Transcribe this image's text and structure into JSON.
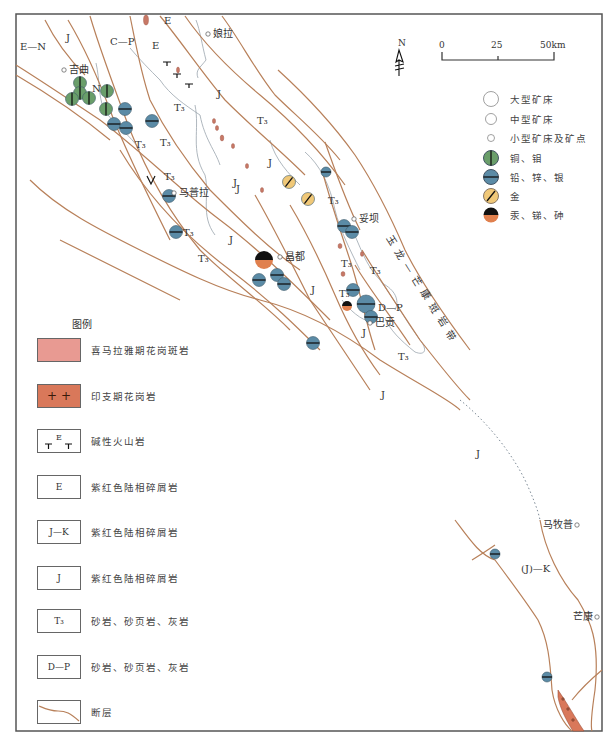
{
  "colors": {
    "fault": "#b8805a",
    "boundary": "#9aa4ad",
    "cu_mo": "#6a9e6a",
    "pb_zn_ag": "#5b8ba6",
    "au": "#f0c878",
    "hg_sb_as_top": "#111111",
    "hg_sb_as_bottom": "#e0804e",
    "himalayan_granite_porphyry": "#e89a92",
    "indosinian_granite": "#d9785a",
    "frame": "#555555"
  },
  "north_arrow": {
    "label": "N"
  },
  "scale_bar": {
    "ticks": [
      "0",
      "25",
      "50km"
    ]
  },
  "deposit_size_legend": [
    {
      "label": "大型矿床",
      "size": "large"
    },
    {
      "label": "中型矿床",
      "size": "medium"
    },
    {
      "label": "小型矿床及矿点",
      "size": "small"
    }
  ],
  "mineral_legend": [
    {
      "label": "铜、钼",
      "type": "cu_mo"
    },
    {
      "label": "铅、锌、银",
      "type": "pb_zn_ag"
    },
    {
      "label": "金",
      "type": "au"
    },
    {
      "label": "汞、锑、砷",
      "type": "hg_sb_as"
    }
  ],
  "legend": {
    "title": "图例",
    "items": [
      {
        "code": "",
        "label": "喜马拉雅期花岗斑岩",
        "style": "himalayan"
      },
      {
        "code": "+ +",
        "label": "印支期花岗岩",
        "style": "indosinian"
      },
      {
        "code": "E",
        "label": "碱性火山岩",
        "style": "volcanic"
      },
      {
        "code": "E",
        "label": "紫红色陆相碎屑岩",
        "style": "plain"
      },
      {
        "code": "J—K",
        "label": "紫红色陆相碎屑岩",
        "style": "plain"
      },
      {
        "code": "J",
        "label": "紫红色陆相碎屑岩",
        "style": "plain"
      },
      {
        "code": "T₃",
        "label": "砂岩、砂页岩、灰岩",
        "style": "plain"
      },
      {
        "code": "D—P",
        "label": "砂岩、砂页岩、灰岩",
        "style": "plain"
      },
      {
        "code": "",
        "label": "断层",
        "style": "fault"
      }
    ]
  },
  "places": [
    {
      "name": "娘拉",
      "x": 212,
      "y": 37
    },
    {
      "name": "吉曲",
      "x": 68,
      "y": 73
    },
    {
      "name": "马普拉",
      "x": 178,
      "y": 196
    },
    {
      "name": "妥坝",
      "x": 358,
      "y": 222
    },
    {
      "name": "昌都",
      "x": 284,
      "y": 260
    },
    {
      "name": "巴贡",
      "x": 374,
      "y": 326
    },
    {
      "name": "马牧普",
      "x": 543,
      "y": 528
    },
    {
      "name": "芒康",
      "x": 573,
      "y": 620
    }
  ],
  "unit_labels": [
    {
      "text": "E—N",
      "x": 20,
      "y": 50
    },
    {
      "text": "J",
      "x": 66,
      "y": 41
    },
    {
      "text": "C—P",
      "x": 110,
      "y": 45
    },
    {
      "text": "E",
      "x": 164,
      "y": 24
    },
    {
      "text": "E",
      "x": 152,
      "y": 49
    },
    {
      "text": "N",
      "x": 92,
      "y": 92
    },
    {
      "text": "J",
      "x": 217,
      "y": 97
    },
    {
      "text": "T₃",
      "x": 174,
      "y": 111
    },
    {
      "text": "T₃",
      "x": 135,
      "y": 148
    },
    {
      "text": "T₃",
      "x": 160,
      "y": 146
    },
    {
      "text": "T₃",
      "x": 164,
      "y": 180
    },
    {
      "text": "J",
      "x": 233,
      "y": 186
    },
    {
      "text": "T₃",
      "x": 257,
      "y": 124
    },
    {
      "text": "J",
      "x": 268,
      "y": 166
    },
    {
      "text": "J",
      "x": 236,
      "y": 192
    },
    {
      "text": "T₃",
      "x": 328,
      "y": 204
    },
    {
      "text": "T₃",
      "x": 183,
      "y": 236
    },
    {
      "text": "J",
      "x": 229,
      "y": 243
    },
    {
      "text": "T₃",
      "x": 198,
      "y": 262
    },
    {
      "text": "J",
      "x": 311,
      "y": 293
    },
    {
      "text": "T₃",
      "x": 341,
      "y": 267
    },
    {
      "text": "T₃",
      "x": 370,
      "y": 274
    },
    {
      "text": "T₃",
      "x": 339,
      "y": 297
    },
    {
      "text": "D—P",
      "x": 378,
      "y": 311
    },
    {
      "text": "J",
      "x": 362,
      "y": 336
    },
    {
      "text": "T₃",
      "x": 398,
      "y": 360
    },
    {
      "text": "J",
      "x": 381,
      "y": 398
    },
    {
      "text": "J",
      "x": 476,
      "y": 457
    },
    {
      "text": "(J)—K",
      "x": 521,
      "y": 572
    }
  ],
  "belt_label": "玉龙—芒康斑岩带",
  "deposits": [
    {
      "type": "cu_mo",
      "size": "medium",
      "x": 80,
      "y": 83
    },
    {
      "type": "cu_mo",
      "size": "medium",
      "x": 80,
      "y": 93
    },
    {
      "type": "cu_mo",
      "size": "medium",
      "x": 72,
      "y": 99
    },
    {
      "type": "cu_mo",
      "size": "medium",
      "x": 89,
      "y": 98
    },
    {
      "type": "cu_mo",
      "size": "medium",
      "x": 107,
      "y": 91
    },
    {
      "type": "cu_mo",
      "size": "medium",
      "x": 106,
      "y": 109
    },
    {
      "type": "pb_zn_ag",
      "size": "medium",
      "x": 125,
      "y": 109
    },
    {
      "type": "pb_zn_ag",
      "size": "medium",
      "x": 114,
      "y": 124
    },
    {
      "type": "pb_zn_ag",
      "size": "medium",
      "x": 126,
      "y": 128
    },
    {
      "type": "pb_zn_ag",
      "size": "medium",
      "x": 152,
      "y": 121
    },
    {
      "type": "pb_zn_ag",
      "size": "medium",
      "x": 169,
      "y": 196
    },
    {
      "type": "pb_zn_ag",
      "size": "medium",
      "x": 176,
      "y": 232
    },
    {
      "type": "pb_zn_ag",
      "size": "small",
      "x": 326,
      "y": 172
    },
    {
      "type": "au",
      "size": "medium",
      "x": 289,
      "y": 182
    },
    {
      "type": "au",
      "size": "medium",
      "x": 308,
      "y": 199
    },
    {
      "type": "pb_zn_ag",
      "size": "medium",
      "x": 344,
      "y": 226
    },
    {
      "type": "pb_zn_ag",
      "size": "medium",
      "x": 352,
      "y": 232
    },
    {
      "type": "hg_sb_as",
      "size": "large",
      "x": 264,
      "y": 260
    },
    {
      "type": "pb_zn_ag",
      "size": "medium",
      "x": 259,
      "y": 280
    },
    {
      "type": "pb_zn_ag",
      "size": "medium",
      "x": 277,
      "y": 275
    },
    {
      "type": "pb_zn_ag",
      "size": "medium",
      "x": 284,
      "y": 284
    },
    {
      "type": "pb_zn_ag",
      "size": "medium",
      "x": 353,
      "y": 290
    },
    {
      "type": "hg_sb_as",
      "size": "small",
      "x": 347,
      "y": 306
    },
    {
      "type": "pb_zn_ag",
      "size": "large",
      "x": 366,
      "y": 304
    },
    {
      "type": "pb_zn_ag",
      "size": "medium",
      "x": 371,
      "y": 317
    },
    {
      "type": "pb_zn_ag",
      "size": "medium",
      "x": 313,
      "y": 343
    },
    {
      "type": "pb_zn_ag",
      "size": "small",
      "x": 495,
      "y": 554
    },
    {
      "type": "pb_zn_ag",
      "size": "small",
      "x": 547,
      "y": 677
    }
  ]
}
